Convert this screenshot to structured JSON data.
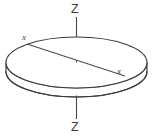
{
  "figure": {
    "kind": "geometry-diagram",
    "background_color": "#ffffff",
    "stroke_color": "#3a3a3a",
    "axis_color": "#4a4a4a",
    "label_color": "#3d3d3d"
  },
  "labels": {
    "z_top": "Z",
    "z_bottom": "Z",
    "x_left": "x",
    "x_right": "x"
  },
  "geometry": {
    "canvas": {
      "width": 155,
      "height": 139
    },
    "disk": {
      "center_x": 76.5,
      "center_y": 62.5,
      "radius_x": 70.5,
      "radius_y": 25.5,
      "thickness": 9.0
    },
    "z_axis": {
      "x": 76.5,
      "top_y": 17,
      "bottom_y": 119,
      "top_label_y": 3,
      "bottom_label_y": 121
    },
    "x_axis": {
      "start_x": 27,
      "start_y": 44,
      "end_x": 125,
      "end_y": 76
    }
  }
}
